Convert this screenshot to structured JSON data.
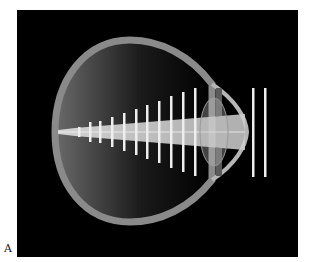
{
  "figure": {
    "panel_label": "A",
    "colors": {
      "background": "#000000",
      "page": "#ffffff",
      "eye_wall": "#8a8a8a",
      "light_beam": "#d8d8d8",
      "bars": "#eeeeee"
    },
    "internal_bars": [
      {
        "x": 79,
        "half_height": 5
      },
      {
        "x": 90,
        "half_height": 10
      },
      {
        "x": 100,
        "half_height": 11
      },
      {
        "x": 112,
        "half_height": 15
      },
      {
        "x": 124,
        "half_height": 19
      },
      {
        "x": 136,
        "half_height": 23
      },
      {
        "x": 147,
        "half_height": 27
      },
      {
        "x": 159,
        "half_height": 31
      },
      {
        "x": 171,
        "half_height": 36
      },
      {
        "x": 183,
        "half_height": 40
      },
      {
        "x": 195,
        "half_height": 44
      }
    ],
    "external_bars": [
      {
        "x": 253,
        "top": 88,
        "bottom": 177
      },
      {
        "x": 265,
        "top": 88,
        "bottom": 177
      }
    ]
  }
}
